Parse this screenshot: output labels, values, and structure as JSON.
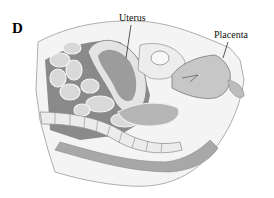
{
  "figure": {
    "panel_letter": "D",
    "labels": [
      {
        "text": "Uterus"
      },
      {
        "text": "Placenta"
      }
    ],
    "colors": {
      "background": "#ffffff",
      "ink": "#111111",
      "tissue_light": "#e6e6e6",
      "tissue_mid": "#bdbdbd",
      "tissue_dark": "#7a7a7a"
    }
  }
}
